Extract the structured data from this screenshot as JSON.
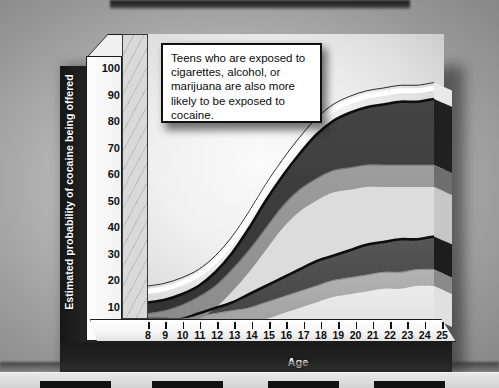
{
  "figure": {
    "callout_text": "Teens who are exposed to cigarettes, alcohol, or marijuana are also more likely to be exposed to cocaine."
  },
  "chart_data": {
    "type": "area",
    "title": "",
    "subtitle": "",
    "xlabel": "Age",
    "ylabel": "Estimated probability of cocaine being offered",
    "xlim": [
      8,
      25
    ],
    "ylim": [
      0,
      100
    ],
    "grid": false,
    "legend_position": "none",
    "annotations": [
      "Teens who are exposed to cigarettes, alcohol, or marijuana are also more likely to be exposed to cocaine."
    ],
    "x": [
      8,
      9,
      10,
      11,
      12,
      13,
      14,
      15,
      16,
      17,
      18,
      19,
      20,
      21,
      22,
      23,
      24,
      25
    ],
    "xtick_labels": [
      "8",
      "9",
      "10",
      "11",
      "12",
      "13",
      "14",
      "15",
      "16",
      "17",
      "18",
      "19",
      "20",
      "21",
      "22",
      "23",
      "24",
      "25"
    ],
    "ytick_labels": [
      "0",
      "10",
      "20",
      "30",
      "40",
      "50",
      "60",
      "70",
      "80",
      "90",
      "100"
    ],
    "ytick_values": [
      0,
      10,
      20,
      30,
      40,
      50,
      60,
      70,
      80,
      90,
      100
    ],
    "series": [
      {
        "name": "Exposed teens - upper bound",
        "shade": "band-upper-top",
        "color": "#3a3a3a",
        "values": [
          6,
          7,
          9,
          12,
          17,
          24,
          33,
          43,
          52,
          60,
          67,
          72,
          75,
          77,
          78,
          79,
          79,
          80
        ]
      },
      {
        "name": "Exposed teens - lower bound",
        "shade": "band-upper-bottom",
        "color": "#8f8f8f",
        "values": [
          2,
          3,
          5,
          8,
          12,
          18,
          25,
          33,
          41,
          47,
          51,
          54,
          55,
          56,
          56,
          56,
          56,
          56
        ]
      },
      {
        "name": "Non-exposed teens - upper bound",
        "shade": "band-lower-top",
        "color": "#4a4a4a",
        "values": [
          0,
          0,
          0,
          2,
          4,
          6,
          9,
          12,
          15,
          18,
          21,
          23,
          25,
          27,
          28,
          29,
          29,
          30
        ]
      },
      {
        "name": "Non-exposed teens - lower bound",
        "shade": "band-lower-bottom",
        "color": "#a8a8a8",
        "values": [
          0,
          0,
          0,
          1,
          2,
          3,
          4,
          6,
          8,
          10,
          12,
          14,
          15,
          16,
          17,
          17,
          18,
          18
        ]
      }
    ]
  }
}
